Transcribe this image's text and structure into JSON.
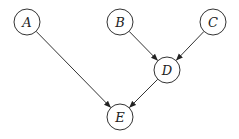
{
  "diagram": {
    "type": "directed-graph",
    "nodes": [
      {
        "id": "A",
        "label": "A"
      },
      {
        "id": "B",
        "label": "B"
      },
      {
        "id": "C",
        "label": "C"
      },
      {
        "id": "D",
        "label": "D"
      },
      {
        "id": "E",
        "label": "E"
      }
    ],
    "edges": [
      {
        "from": "A",
        "to": "E"
      },
      {
        "from": "B",
        "to": "D"
      },
      {
        "from": "C",
        "to": "D"
      },
      {
        "from": "D",
        "to": "E"
      }
    ]
  }
}
